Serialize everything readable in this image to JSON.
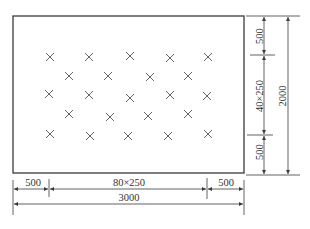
{
  "diagram": {
    "title": "",
    "colors": {
      "line": "#3a3a3a",
      "mark": "#555555",
      "background": "#ffffff"
    },
    "plate": {
      "x": 13,
      "y": 16,
      "w": 231,
      "h": 157
    },
    "marks": [
      {
        "x": 50,
        "y": 57
      },
      {
        "x": 89,
        "y": 57
      },
      {
        "x": 130,
        "y": 56
      },
      {
        "x": 170,
        "y": 58
      },
      {
        "x": 208,
        "y": 57
      },
      {
        "x": 69,
        "y": 76
      },
      {
        "x": 108,
        "y": 76
      },
      {
        "x": 150,
        "y": 77
      },
      {
        "x": 188,
        "y": 76
      },
      {
        "x": 49,
        "y": 94
      },
      {
        "x": 89,
        "y": 95
      },
      {
        "x": 130,
        "y": 98
      },
      {
        "x": 170,
        "y": 95
      },
      {
        "x": 207,
        "y": 96
      },
      {
        "x": 69,
        "y": 114
      },
      {
        "x": 110,
        "y": 117
      },
      {
        "x": 148,
        "y": 116
      },
      {
        "x": 188,
        "y": 114
      },
      {
        "x": 50,
        "y": 134
      },
      {
        "x": 90,
        "y": 136
      },
      {
        "x": 128,
        "y": 136
      },
      {
        "x": 168,
        "y": 136
      },
      {
        "x": 208,
        "y": 134
      }
    ],
    "dimensions": {
      "bottom": {
        "left_margin": "500",
        "middle": "80×250",
        "right_margin": "500",
        "total": "3000"
      },
      "right": {
        "top_margin": "500",
        "middle": "40×250",
        "bottom_margin": "500",
        "total": "2000"
      }
    }
  }
}
